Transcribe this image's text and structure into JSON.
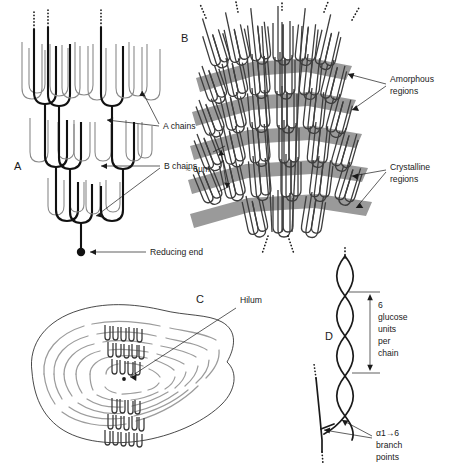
{
  "figure": {
    "background_color": "#ffffff"
  },
  "panels": [
    {
      "id": "A",
      "letter": "A",
      "name": "amylopectin-cluster-molecule",
      "description": "Branched amylopectin molecule showing A chains, B chains and the reducing end"
    },
    {
      "id": "B",
      "letter": "B",
      "name": "stacked-lamellae",
      "description": "Stacked clusters forming alternating crystalline and amorphous lamellae"
    },
    {
      "id": "C",
      "letter": "C",
      "name": "starch-granule-growth-rings",
      "description": "Whole starch granule cross section with growth rings and hilum"
    },
    {
      "id": "D",
      "letter": "D",
      "name": "double-helix-detail",
      "description": "Double helix formed by adjacent chains with alpha-1,6 branch points"
    }
  ],
  "labels": {
    "a_chains": "A chains",
    "b_chains": "B chains",
    "reducing_end": "Reducing end",
    "amorphous_regions_line1": "Amorphous",
    "amorphous_regions_line2": "regions",
    "crystalline_regions_line1": "Crystalline",
    "crystalline_regions_line2": "regions",
    "scale_bar": "≈ 6µm",
    "hilum": "Hilum",
    "glucose_units_line1": "6",
    "glucose_units_line2": "glucose",
    "glucose_units_line3": "units",
    "glucose_units_line4": "per",
    "glucose_units_line5": "chain",
    "branch_points_line1": "α1→6",
    "branch_points_line2": "branch",
    "branch_points_line3": "points"
  },
  "colors": {
    "ink": "#1a1a1a",
    "chain_dark": "#111111",
    "chain_light": "#8a8a8a",
    "lamella_gray": "#9a9a9a",
    "growth_ring_gray": "#9c9c9c",
    "background": "#ffffff"
  },
  "measurements": {
    "lamella_repeat_value": 6,
    "lamella_repeat_unit": "µm",
    "glucose_units_per_chain": 6,
    "branch_linkage": "α1→6"
  }
}
